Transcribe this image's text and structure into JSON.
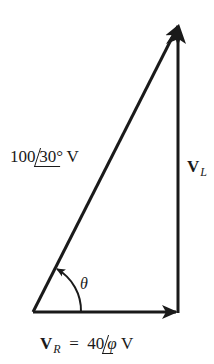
{
  "diagram": {
    "type": "phasor-triangle",
    "vertices": {
      "origin": [
        33,
        312
      ],
      "right_angle": [
        178,
        312
      ],
      "apex": [
        179,
        25
      ]
    },
    "colors": {
      "stroke": "#1a1a1a",
      "background": "#ffffff"
    }
  },
  "labels": {
    "hypotenuse": {
      "magnitude": "100",
      "angle": "30°",
      "unit": "V"
    },
    "vertical": {
      "symbol": "V",
      "subscript": "L"
    },
    "angle": {
      "symbol": "θ"
    },
    "horizontal": {
      "symbol": "V",
      "subscript": "R",
      "equals": "=",
      "magnitude": "40",
      "angle": "φ",
      "unit": "V"
    }
  }
}
